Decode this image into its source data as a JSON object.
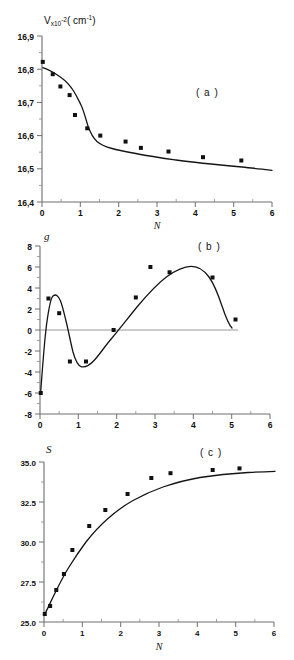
{
  "figure": {
    "title": "",
    "panels": [
      "a",
      "b",
      "c"
    ]
  },
  "panel_a": {
    "letter": "( a )",
    "ylabel_main": "V",
    "ylabel_x": "x10",
    "ylabel_exp1": "-2",
    "ylabel_unit_open": "( cm",
    "ylabel_exp2": "-1",
    "ylabel_unit_close": ")",
    "xlabel": "N",
    "yticks": [
      "16,9",
      "16,8",
      "16,7",
      "16,6",
      "16,5",
      "16,4"
    ],
    "xticks": [
      "0",
      "1",
      "2",
      "3",
      "4",
      "5",
      "6"
    ]
  },
  "panel_b": {
    "letter": "( b )",
    "ylabel": "g",
    "xlabel": "N",
    "yticks": [
      "8",
      "6",
      "4",
      "2",
      "0",
      "-2",
      "-4",
      "-6",
      "-8"
    ],
    "xticks": [
      "0",
      "1",
      "2",
      "3",
      "4",
      "5",
      "6"
    ]
  },
  "panel_c": {
    "letter": "( c )",
    "ylabel": "S",
    "xlabel": "N",
    "yticks": [
      "35.0",
      "32.5",
      "30.0",
      "27.5",
      "25.0"
    ],
    "xticks": [
      "0",
      "1",
      "2",
      "3",
      "4",
      "5",
      "6"
    ]
  },
  "chart_data": [
    {
      "type": "scatter",
      "panel": "a",
      "title": "( a )",
      "xlabel": "N",
      "ylabel": "V×10⁻² ( cm⁻¹ )",
      "xlim": [
        0,
        6
      ],
      "ylim": [
        16.4,
        16.9
      ],
      "xticks": [
        0,
        1,
        2,
        3,
        4,
        5,
        6
      ],
      "yticks": [
        16.4,
        16.5,
        16.6,
        16.7,
        16.8,
        16.9
      ],
      "grid": false,
      "legend": false,
      "points": [
        {
          "x": 0.02,
          "y": 16.822
        },
        {
          "x": 0.28,
          "y": 16.785
        },
        {
          "x": 0.48,
          "y": 16.748
        },
        {
          "x": 0.72,
          "y": 16.722
        },
        {
          "x": 0.86,
          "y": 16.662
        },
        {
          "x": 1.18,
          "y": 16.622
        },
        {
          "x": 1.52,
          "y": 16.6
        },
        {
          "x": 2.18,
          "y": 16.582
        },
        {
          "x": 2.58,
          "y": 16.563
        },
        {
          "x": 3.3,
          "y": 16.552
        },
        {
          "x": 4.2,
          "y": 16.535
        },
        {
          "x": 5.2,
          "y": 16.525
        }
      ],
      "fit_curve": "monotonic decreasing sigmoid-like decay from 16.82 to 16.52"
    },
    {
      "type": "scatter",
      "panel": "b",
      "title": "( b )",
      "xlabel": "N",
      "ylabel": "g",
      "xlim": [
        0,
        6
      ],
      "ylim": [
        -8,
        8
      ],
      "xticks": [
        0,
        1,
        2,
        3,
        4,
        5,
        6
      ],
      "yticks": [
        -8,
        -6,
        -4,
        -2,
        0,
        2,
        4,
        6,
        8
      ],
      "grid": false,
      "zero_line": true,
      "legend": false,
      "points": [
        {
          "x": 0.02,
          "y": -6.0
        },
        {
          "x": 0.22,
          "y": 3.0
        },
        {
          "x": 0.5,
          "y": 1.6
        },
        {
          "x": 0.78,
          "y": -3.0
        },
        {
          "x": 1.2,
          "y": -3.0
        },
        {
          "x": 1.92,
          "y": 0.0
        },
        {
          "x": 2.5,
          "y": 3.1
        },
        {
          "x": 2.88,
          "y": 6.0
        },
        {
          "x": 3.38,
          "y": 5.5
        },
        {
          "x": 4.5,
          "y": 5.0
        },
        {
          "x": 5.1,
          "y": 1.0
        }
      ],
      "fit_curve": "sharp rise from -6 to peak ~3.2 at N=0.25, dip to ~-3.4 near N=1.0, broad rise to max ~6.3 at N=3.6, then decline to ~1 at N=5.2"
    },
    {
      "type": "scatter",
      "panel": "c",
      "title": "( c )",
      "xlabel": "N",
      "ylabel": "S",
      "xlim": [
        0,
        6
      ],
      "ylim": [
        25.0,
        35.0
      ],
      "xticks": [
        0,
        1,
        2,
        3,
        4,
        5,
        6
      ],
      "yticks": [
        25.0,
        27.5,
        30.0,
        32.5,
        35.0
      ],
      "grid": false,
      "legend": false,
      "points": [
        {
          "x": 0.02,
          "y": 25.5
        },
        {
          "x": 0.16,
          "y": 26.0
        },
        {
          "x": 0.32,
          "y": 27.0
        },
        {
          "x": 0.52,
          "y": 28.0
        },
        {
          "x": 0.74,
          "y": 29.5
        },
        {
          "x": 1.18,
          "y": 31.0
        },
        {
          "x": 1.6,
          "y": 32.0
        },
        {
          "x": 2.18,
          "y": 33.0
        },
        {
          "x": 2.8,
          "y": 34.0
        },
        {
          "x": 3.3,
          "y": 34.3
        },
        {
          "x": 4.4,
          "y": 34.5
        },
        {
          "x": 5.1,
          "y": 34.6
        }
      ],
      "fit_curve": "saturating exponential growth from 25.5 to plateau near 34.6"
    }
  ]
}
